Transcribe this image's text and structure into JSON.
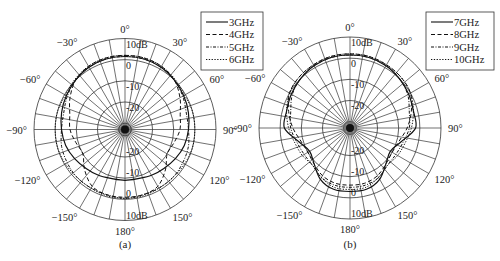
{
  "chart_data": [
    {
      "type": "polar",
      "caption": "(a)",
      "center": [
        125,
        129.5
      ],
      "radius": 91,
      "r_axis": {
        "unit": "dB",
        "min": -33,
        "max": 10,
        "rings": [
          10,
          0,
          -10,
          -20,
          -30
        ],
        "ring_labels": [
          "10dB",
          "0",
          "-10",
          "-20",
          "-30"
        ]
      },
      "angle_ticks": [
        0,
        30,
        60,
        90,
        120,
        150,
        180,
        -150,
        -120,
        -90,
        -60,
        -30
      ],
      "angle_labels": [
        "0°",
        "30°",
        "60°",
        "90°",
        "120°",
        "150°",
        "180°",
        "−150°",
        "−120°",
        "−90°",
        "−60°",
        "−30°"
      ],
      "radial_line_step_deg": 10,
      "grid": true,
      "legend": {
        "position": "top-right",
        "entries": [
          "3GHz",
          "4GHz",
          "5GHz",
          "6GHz"
        ]
      },
      "angles_deg": [
        0,
        15,
        30,
        45,
        60,
        75,
        90,
        105,
        120,
        135,
        150,
        165,
        180,
        195,
        210,
        225,
        240,
        255,
        270,
        285,
        300,
        315,
        330,
        345
      ],
      "series": [
        {
          "name": "3GHz",
          "style": "solid",
          "values": [
            1.5,
            1.5,
            1,
            0,
            -1,
            -2,
            -3,
            -4,
            -5.5,
            -7,
            -8,
            -9,
            -9,
            -9,
            -8,
            -7,
            -5.5,
            -4,
            -3,
            -2,
            -1,
            0,
            1,
            1.5
          ]
        },
        {
          "name": "4GHz",
          "style": "dashed",
          "values": [
            2,
            2,
            1.5,
            0,
            -3,
            -6,
            -7,
            -9,
            -10,
            -6,
            -2,
            -1,
            -1,
            -1,
            -2,
            -6,
            -10,
            -9,
            -7,
            -6,
            -3,
            0,
            1.5,
            2
          ]
        },
        {
          "name": "5GHz",
          "style": "dashdot",
          "values": [
            1.5,
            1.5,
            1,
            0,
            -1.5,
            -3,
            -3,
            -2,
            -1.5,
            -1,
            -1,
            -1,
            -0.5,
            -1,
            -1,
            -1,
            -1.5,
            -2,
            -3,
            -3,
            -1.5,
            0,
            1,
            1.5
          ]
        },
        {
          "name": "6GHz",
          "style": "dotted",
          "values": [
            2,
            2,
            1.5,
            0.5,
            -0.5,
            0,
            0,
            0,
            -0.5,
            -1,
            -1,
            -0.5,
            -0.5,
            -0.5,
            -1,
            -1,
            -0.5,
            0,
            0,
            0,
            -0.5,
            0.5,
            1.5,
            2
          ]
        }
      ]
    },
    {
      "type": "polar",
      "caption": "(b)",
      "center": [
        350,
        128
      ],
      "radius": 91,
      "r_axis": {
        "unit": "dB",
        "min": -33,
        "max": 10,
        "rings": [
          10,
          0,
          -10,
          -20,
          -30
        ],
        "ring_labels": [
          "10dB",
          "0",
          "-10",
          "-20",
          "-30"
        ]
      },
      "angle_ticks": [
        0,
        30,
        60,
        90,
        120,
        150,
        180,
        -150,
        -120,
        -90,
        -60,
        -30
      ],
      "angle_labels": [
        "0°",
        "30°",
        "60°",
        "90°",
        "120°",
        "150°",
        "180°",
        "−150°",
        "−120°",
        "−90°",
        "−60°",
        "−30°"
      ],
      "radial_line_step_deg": 10,
      "grid": true,
      "legend": {
        "position": "top-right",
        "entries": [
          "7GHz",
          "8GHz",
          "9GHz",
          "10GHz"
        ]
      },
      "angles_deg": [
        0,
        15,
        30,
        45,
        60,
        75,
        90,
        105,
        120,
        135,
        150,
        165,
        180,
        195,
        210,
        225,
        240,
        255,
        270,
        285,
        300,
        315,
        330,
        345
      ],
      "series": [
        {
          "name": "7GHz",
          "style": "solid",
          "values": [
            1.5,
            1.5,
            1,
            0,
            -1,
            -2,
            -2,
            -8,
            -11,
            -9,
            -5,
            -3,
            -3,
            -3,
            -5,
            -9,
            -11,
            -8,
            -2,
            -2,
            -1,
            0,
            1,
            1.5
          ]
        },
        {
          "name": "8GHz",
          "style": "dashed",
          "values": [
            2,
            2,
            1.5,
            1,
            0,
            -3,
            -6,
            -9,
            -10,
            -9,
            -7,
            -6,
            -6,
            -6,
            -7,
            -9,
            -10,
            -9,
            -6,
            -3,
            0,
            1,
            1.5,
            2
          ]
        },
        {
          "name": "9GHz",
          "style": "dashdot",
          "values": [
            1.5,
            1.5,
            1,
            0,
            -1.5,
            -4,
            -5,
            -7,
            -8,
            -8,
            -6,
            -5,
            -5,
            -5,
            -6,
            -8,
            -8,
            -7,
            -5,
            -4,
            -1.5,
            0,
            1,
            1.5
          ]
        },
        {
          "name": "10GHz",
          "style": "dotted",
          "values": [
            2,
            2,
            1.5,
            1,
            0,
            -2,
            -4,
            -6,
            -7,
            -8,
            -6,
            -4,
            -4,
            -4,
            -6,
            -8,
            -7,
            -6,
            -4,
            -2,
            0,
            1,
            1.5,
            2
          ]
        }
      ]
    }
  ]
}
